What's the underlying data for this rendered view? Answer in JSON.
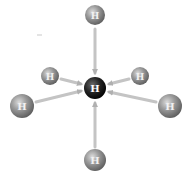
{
  "diagram": {
    "type": "molecular-interaction-diagram",
    "center_atom": {
      "label": "H",
      "x": 95,
      "y": 88,
      "r": 11,
      "color": "#1e1e1e"
    },
    "neighbor_atoms": [
      {
        "id": "top",
        "label": "H",
        "x": 95,
        "y": 15,
        "r": 10
      },
      {
        "id": "upper-left",
        "label": "H",
        "x": 50,
        "y": 76,
        "r": 9
      },
      {
        "id": "upper-right",
        "label": "H",
        "x": 140,
        "y": 76,
        "r": 9
      },
      {
        "id": "left",
        "label": "H",
        "x": 22,
        "y": 106,
        "r": 12
      },
      {
        "id": "right",
        "label": "H",
        "x": 170,
        "y": 106,
        "r": 12
      },
      {
        "id": "bottom",
        "label": "H",
        "x": 95,
        "y": 160,
        "r": 11
      }
    ],
    "arrow_color": "#c8c8c8",
    "neighbor_color": "#8c8c8c",
    "arrow_direction": "toward-center"
  }
}
